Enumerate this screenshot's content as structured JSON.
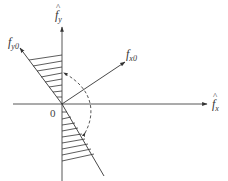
{
  "diagram": {
    "title": "",
    "axes": {
      "horizontal": {
        "label_base": "f",
        "label_sub": "x",
        "hat": "^"
      },
      "vertical": {
        "label_base": "f",
        "label_sub": "y",
        "hat": "^"
      }
    },
    "vectors": {
      "fy0": {
        "label_base": "f",
        "label_sub": "y0"
      },
      "fx0": {
        "label_base": "f",
        "label_sub": "x0"
      }
    },
    "origin_label": "0",
    "colors": {
      "line": "#333333",
      "hatch": "#333333",
      "background": "#ffffff"
    }
  }
}
